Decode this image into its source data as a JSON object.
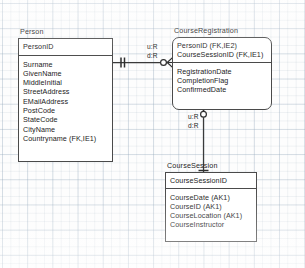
{
  "diagram": {
    "type": "entity-relationship-diagram",
    "notation": "IDEF1X",
    "background": "graph-paper-grid",
    "line_color": "#4a4a4a"
  },
  "entities": [
    {
      "id": "person",
      "title": "Person",
      "corner_style": "square",
      "keys": [
        "PersonID"
      ],
      "attributes": [
        "Surname",
        "GivenName",
        "MiddleInitial",
        "StreetAddress",
        "EMailAddress",
        "PostCode",
        "StateCode",
        "CityName",
        "Countryname (FK,IE1)"
      ]
    },
    {
      "id": "course_registration",
      "title": "CourseRegistration",
      "corner_style": "rounded",
      "keys": [
        "PersonID (FK,IE2)",
        "CourseSessionID (FK,IE1)"
      ],
      "attributes": [
        "RegistrationDate",
        "CompletionFlag",
        "ConfirmedDate"
      ]
    },
    {
      "id": "course_session",
      "title": "CourseSession",
      "corner_style": "square",
      "keys": [
        "CourseSessionID"
      ],
      "attributes": [
        "CourseDate (AK1)",
        "CourseID (AK1)",
        "CourseLocation (AK1)",
        "CourseInstructor"
      ]
    }
  ],
  "relationships": [
    {
      "id": "person_to_registration",
      "from": "person",
      "to": "course_registration",
      "orientation": "horizontal",
      "parent_cardinality": "exactly-one",
      "child_cardinality": "zero-or-more",
      "update_rule": "u:R",
      "delete_rule": "d:R"
    },
    {
      "id": "session_to_registration",
      "from": "course_session",
      "to": "course_registration",
      "orientation": "vertical",
      "parent_cardinality": "exactly-one",
      "child_cardinality": "zero-or-more",
      "update_rule": "u:R",
      "delete_rule": "d:R"
    }
  ]
}
